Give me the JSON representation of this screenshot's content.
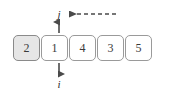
{
  "diagram": {
    "array": {
      "label": "array-cells",
      "cells": [
        {
          "value": "2",
          "highlighted": true
        },
        {
          "value": "1",
          "highlighted": false
        },
        {
          "value": "4",
          "highlighted": false
        },
        {
          "value": "3",
          "highlighted": false
        },
        {
          "value": "5",
          "highlighted": false
        }
      ]
    },
    "pointers": [
      {
        "name": "j",
        "label": "j",
        "position": "top",
        "arrow": "up-arrow-to-j"
      },
      {
        "name": "i",
        "label": "i",
        "position": "bottom",
        "arrow": "down-arrow-to-i"
      }
    ],
    "dashed_arrow": {
      "name": "dashed-arrow-left",
      "direction": "left",
      "style": "dashed"
    },
    "colors": {
      "cell_border": "#9a9a9a",
      "cell_fill": "#ffffff",
      "cell_fill_highlight": "#e6e6e6",
      "text": "#3a3a3a",
      "arrow": "#4a4a4a",
      "background": "#ffffff"
    }
  }
}
